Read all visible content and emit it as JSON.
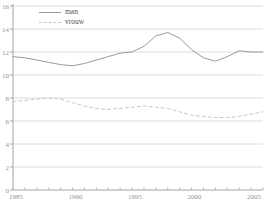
{
  "chart_data": {
    "type": "line",
    "title": "",
    "xlabel": "",
    "ylabel": "",
    "x": [
      1985,
      1986,
      1987,
      1988,
      1989,
      1990,
      1991,
      1992,
      1993,
      1994,
      1995,
      1996,
      1997,
      1998,
      1999,
      2000,
      2001,
      2002,
      2003,
      2004,
      2005,
      2006
    ],
    "series": [
      {
        "name": "man",
        "style": "solid",
        "color": "#9a9a98",
        "values": [
          11.6,
          11.5,
          11.3,
          11.1,
          10.9,
          10.8,
          11.0,
          11.3,
          11.6,
          11.9,
          12.0,
          12.5,
          13.4,
          13.7,
          13.2,
          12.2,
          11.5,
          11.2,
          11.6,
          12.1,
          12.0,
          12.0
        ]
      },
      {
        "name": "vrouw",
        "style": "dashed",
        "color": "#c6c6c2",
        "values": [
          7.7,
          7.8,
          7.9,
          8.0,
          7.9,
          7.6,
          7.3,
          7.1,
          7.0,
          7.1,
          7.2,
          7.3,
          7.2,
          7.1,
          6.8,
          6.5,
          6.4,
          6.3,
          6.3,
          6.4,
          6.6,
          6.8
        ]
      }
    ],
    "xlim": [
      1985,
      2006
    ],
    "ylim": [
      0,
      16
    ],
    "xticks": [
      1985,
      1990,
      1995,
      2000,
      2005
    ],
    "yticks": [
      0,
      2,
      4,
      6,
      8,
      10,
      12,
      14,
      16
    ],
    "grid": "horizontal",
    "legend_position": "top-left",
    "colors": {
      "axis": "#a6a49b",
      "gridline": "#dddcd6",
      "minor_tick": "#b5b3aa",
      "tick_text": "#98948a",
      "background": "#ffffff"
    }
  }
}
